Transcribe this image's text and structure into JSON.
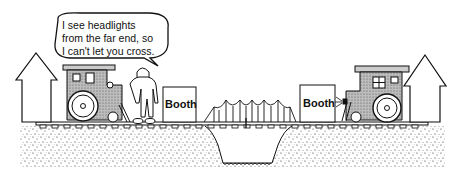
{
  "speech_bubble": {
    "lines": [
      "I see headlights",
      "from the far end, so",
      "I can't let you cross."
    ]
  },
  "booths": [
    {
      "label": "Booth",
      "side": "left"
    },
    {
      "label": "Booth",
      "side": "right"
    }
  ],
  "elements": {
    "left_house": "house-outline",
    "left_train": "locomotive-facing-right",
    "person": "booth-attendant",
    "bridge": "suspension-bridge",
    "right_train": "locomotive-facing-left-with-headlight",
    "right_house": "house-outline"
  },
  "colors": {
    "ink": "#111111",
    "background": "#ffffff",
    "shading": "#9a9a9a"
  }
}
